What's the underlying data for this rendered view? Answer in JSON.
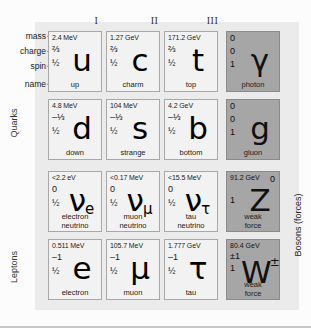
{
  "figure": {
    "row_labels": {
      "mass": "mass",
      "charge": "charge",
      "spin": "spin",
      "name": "name",
      "arrow": "➜"
    },
    "column_headers": [
      "I",
      "II",
      "III"
    ],
    "group_labels": {
      "quarks": "Quarks",
      "leptons": "Leptons",
      "bosons": "Bosons (forces)"
    },
    "colors": {
      "fermion_cell": "#f2f2f2",
      "boson_cell": "#a6a6a6",
      "panel": "#ebebeb",
      "cell_border": "#a8a8a8",
      "text": "#1b1b1b"
    }
  },
  "particles": {
    "row1": [
      {
        "mass": "2.4 MeV",
        "charge": "⅔",
        "spin": "½",
        "symbol": "u",
        "sub": "",
        "sup": "",
        "name": "up",
        "name2": "",
        "kind": "fermion"
      },
      {
        "mass": "1.27 GeV",
        "charge": "⅔",
        "spin": "½",
        "symbol": "c",
        "sub": "",
        "sup": "",
        "name": "charm",
        "name2": "",
        "kind": "fermion"
      },
      {
        "mass": "171.2 GeV",
        "charge": "⅔",
        "spin": "½",
        "symbol": "t",
        "sub": "",
        "sup": "",
        "name": "top",
        "name2": "",
        "kind": "fermion"
      },
      {
        "mass": "0",
        "charge": "0",
        "spin": "1",
        "symbol": "γ",
        "sub": "",
        "sup": "",
        "name": "photon",
        "name2": "",
        "kind": "boson"
      }
    ],
    "row2": [
      {
        "mass": "4.8 MeV",
        "charge": "–⅓",
        "spin": "½",
        "symbol": "d",
        "sub": "",
        "sup": "",
        "name": "down",
        "name2": "",
        "kind": "fermion"
      },
      {
        "mass": "104 MeV",
        "charge": "–⅓",
        "spin": "½",
        "symbol": "s",
        "sub": "",
        "sup": "",
        "name": "strange",
        "name2": "",
        "kind": "fermion"
      },
      {
        "mass": "4.2 GeV",
        "charge": "–⅓",
        "spin": "½",
        "symbol": "b",
        "sub": "",
        "sup": "",
        "name": "bottom",
        "name2": "",
        "kind": "fermion"
      },
      {
        "mass": "0",
        "charge": "0",
        "spin": "1",
        "symbol": "g",
        "sub": "",
        "sup": "",
        "name": "gluon",
        "name2": "",
        "kind": "boson"
      }
    ],
    "row3": [
      {
        "mass": "<2.2 eV",
        "charge": "0",
        "spin": "½",
        "symbol": "ν",
        "sub": "e",
        "sup": "",
        "name": "electron",
        "name2": "neutrino",
        "kind": "fermion"
      },
      {
        "mass": "<0.17 MeV",
        "charge": "0",
        "spin": "½",
        "symbol": "ν",
        "sub": "μ",
        "sup": "",
        "name": "muon",
        "name2": "neutrino",
        "kind": "fermion"
      },
      {
        "mass": "<15.5 MeV",
        "charge": "0",
        "spin": "½",
        "symbol": "ν",
        "sub": "τ",
        "sup": "",
        "name": "tau",
        "name2": "neutrino",
        "kind": "fermion"
      },
      {
        "mass": "91.2 GeV",
        "charge": "0",
        "spin": "1",
        "symbol": "Z",
        "sub": "",
        "sup": "",
        "name": "weak",
        "name2": "force",
        "kind": "boson"
      }
    ],
    "row4": [
      {
        "mass": "0.511 MeV",
        "charge": "–1",
        "spin": "½",
        "symbol": "e",
        "sub": "",
        "sup": "",
        "name": "electron",
        "name2": "",
        "kind": "fermion"
      },
      {
        "mass": "105.7 MeV",
        "charge": "–1",
        "spin": "½",
        "symbol": "μ",
        "sub": "",
        "sup": "",
        "name": "muon",
        "name2": "",
        "kind": "fermion"
      },
      {
        "mass": "1.777 GeV",
        "charge": "–1",
        "spin": "½",
        "symbol": "τ",
        "sub": "",
        "sup": "",
        "name": "tau",
        "name2": "",
        "kind": "fermion"
      },
      {
        "mass": "80.4 GeV",
        "charge": "±1",
        "spin": "1",
        "symbol": "W",
        "sub": "",
        "sup": "±",
        "name": "weak",
        "name2": "force",
        "kind": "boson"
      }
    ]
  }
}
